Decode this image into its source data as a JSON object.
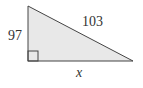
{
  "figure": {
    "type": "right-triangle",
    "labels": {
      "vertical_leg": "97",
      "hypotenuse": "103",
      "horizontal_leg": "x"
    },
    "colors": {
      "fill": "#e8e8e8",
      "stroke": "#444444",
      "text": "#333333"
    }
  }
}
